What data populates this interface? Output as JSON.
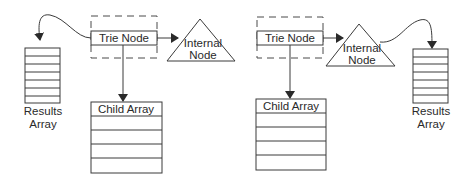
{
  "diagram": {
    "colors": {
      "line": "#3a3a3a",
      "text": "#2a2a2a",
      "background": "#ffffff"
    },
    "left": {
      "trie_node": {
        "label": "Trie Node"
      },
      "internal_node": {
        "line1": "Internal",
        "line2": "Node"
      },
      "results_array": {
        "line1": "Results",
        "line2": "Array",
        "rows": 7
      },
      "child_array": {
        "label": "Child Array",
        "rows": 4
      }
    },
    "right": {
      "trie_node": {
        "label": "Trie Node"
      },
      "internal_node": {
        "line1": "Internal",
        "line2": "Node"
      },
      "results_array": {
        "line1": "Results",
        "line2": "Array",
        "rows": 7
      },
      "child_array": {
        "label": "Child Array",
        "rows": 4
      }
    }
  }
}
